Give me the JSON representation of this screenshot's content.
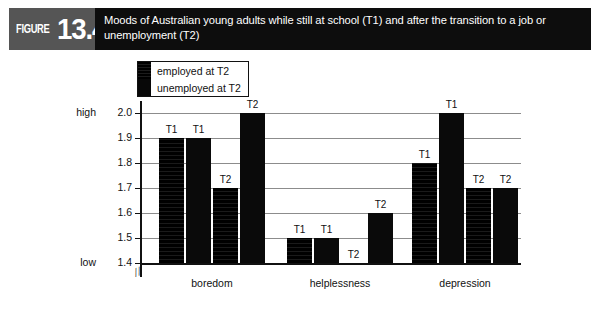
{
  "figure": {
    "badge_word": "FIGURE",
    "badge_number": "13.4",
    "title": "Moods of Australian young adults while still at school (T1) and after the transition to a job or unemployment (T2)"
  },
  "legend": {
    "items": [
      {
        "label": "employed at T2",
        "swatch": "black-textured"
      },
      {
        "label": "unemployed at T2",
        "swatch": "black-solid"
      }
    ]
  },
  "axis": {
    "high_label": "high",
    "low_label": "low",
    "ticks": [
      "2.0",
      "1.9",
      "1.8",
      "1.7",
      "1.6",
      "1.5",
      "1.4"
    ],
    "break_symbol": "//"
  },
  "chart_data": {
    "type": "bar",
    "title": "Moods of Australian young adults while still at school (T1) and after the transition to a job or unemployment (T2)",
    "xlabel": "",
    "ylabel": "",
    "ylim": [
      1.4,
      2.0
    ],
    "yticks": [
      1.4,
      1.5,
      1.6,
      1.7,
      1.8,
      1.9,
      2.0
    ],
    "ytick_labels": [
      "1.4",
      "1.5",
      "1.6",
      "1.7",
      "1.8",
      "1.9",
      "2.0"
    ],
    "y_extreme_labels": {
      "top": "high",
      "bottom": "low"
    },
    "grid": true,
    "legend_position": "top-left-inside",
    "axis_break": true,
    "categories": [
      "boredom",
      "helplessness",
      "depression"
    ],
    "series": [
      {
        "name": "employed at T2",
        "time": "T1",
        "values": [
          1.9,
          1.5,
          1.8
        ],
        "point_labels": [
          "T1",
          "T1",
          "T1"
        ]
      },
      {
        "name": "unemployed at T2",
        "time": "T1",
        "values": [
          1.9,
          1.5,
          2.0
        ],
        "point_labels": [
          "T1",
          "T1",
          "T1"
        ]
      },
      {
        "name": "employed at T2",
        "time": "T2",
        "values": [
          1.7,
          1.4,
          1.7
        ],
        "point_labels": [
          "T2",
          "T2",
          "T2"
        ]
      },
      {
        "name": "unemployed at T2",
        "time": "T2",
        "values": [
          2.0,
          1.6,
          1.7
        ],
        "point_labels": [
          "T2",
          "T2",
          "T2"
        ]
      }
    ]
  },
  "colors": {
    "bar": "#0a0a0a",
    "header_bg": "#0d0d0d",
    "badge_bg": "#555555",
    "grid": "#8c8c8c",
    "frame": "#111111"
  }
}
